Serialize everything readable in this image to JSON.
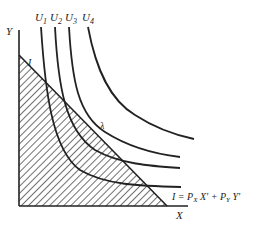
{
  "diagram": {
    "type": "indifference-curves-budget-constraint",
    "axes": {
      "x_label": "X",
      "y_label": "Y"
    },
    "curves": [
      {
        "label": "U",
        "sub": "1"
      },
      {
        "label": "U",
        "sub": "2"
      },
      {
        "label": "U",
        "sub": "3"
      },
      {
        "label": "U",
        "sub": "4"
      }
    ],
    "budget_line": {
      "intercept_label": "I",
      "equation": {
        "lhs": "I = P",
        "sub_x": "X",
        "mid": " X' + P",
        "sub_y": "Y",
        "rhs": " Y'"
      }
    },
    "point_label": "λ",
    "colors": {
      "line": "#222222",
      "hatch": "#333333",
      "background": "#ffffff"
    }
  }
}
